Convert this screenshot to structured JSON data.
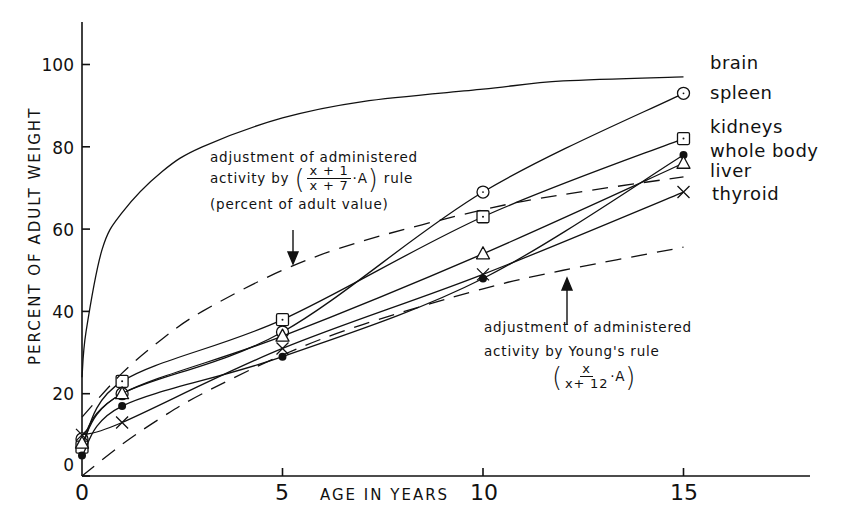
{
  "chart_data": {
    "type": "line",
    "title": "",
    "xlabel": "AGE IN YEARS",
    "ylabel": "PERCENT OF ADULT WEIGHT",
    "xlim": [
      0,
      18
    ],
    "ylim": [
      0,
      110
    ],
    "x_ticks": [
      "0",
      "5",
      "10",
      "15"
    ],
    "y_ticks": [
      "0",
      "20",
      "40",
      "60",
      "80",
      "100"
    ],
    "grid": false,
    "legend_position": "right, inline labels at line ends",
    "series": [
      {
        "name": "brain",
        "marker": "none",
        "style": "solid",
        "x": [
          0,
          0.1,
          0.5,
          1,
          2,
          3,
          5,
          7,
          10,
          12,
          15
        ],
        "y": [
          24,
          35,
          55,
          64,
          74,
          80,
          87,
          91,
          94,
          96,
          97
        ]
      },
      {
        "name": "spleen",
        "marker": "circle",
        "style": "solid",
        "x": [
          0,
          1,
          5,
          10,
          15
        ],
        "y": [
          9,
          20,
          35,
          69,
          93
        ]
      },
      {
        "name": "kidneys",
        "marker": "square",
        "style": "solid",
        "x": [
          0,
          1,
          5,
          10,
          15
        ],
        "y": [
          7,
          23,
          38,
          63,
          82
        ]
      },
      {
        "name": "whole body",
        "marker": "filled-circle",
        "style": "solid",
        "x": [
          0,
          1,
          5,
          10,
          15
        ],
        "y": [
          5,
          17,
          29,
          48,
          78
        ]
      },
      {
        "name": "liver",
        "marker": "triangle",
        "style": "solid",
        "x": [
          0,
          1,
          5,
          10,
          15
        ],
        "y": [
          8,
          20,
          34,
          54,
          76
        ]
      },
      {
        "name": "thyroid",
        "marker": "x",
        "style": "solid",
        "x": [
          0,
          1,
          5,
          10,
          15
        ],
        "y": [
          10,
          13,
          31,
          49,
          69
        ]
      },
      {
        "name": "(x+1)/(x+7)·A rule",
        "marker": "none",
        "style": "dashed",
        "x": [
          0,
          1,
          2,
          3,
          5,
          7,
          10,
          12,
          15
        ],
        "y": [
          14.3,
          25,
          33.3,
          40,
          50,
          57.1,
          64.7,
          68.4,
          72.7
        ]
      },
      {
        "name": "Young's rule x/(x+12)·A",
        "marker": "none",
        "style": "dashed",
        "x": [
          0,
          1,
          2,
          3,
          5,
          7,
          10,
          12,
          15
        ],
        "y": [
          0,
          7.7,
          14.3,
          20,
          29.4,
          36.8,
          45.5,
          50,
          55.6
        ]
      }
    ],
    "annotations": [
      {
        "text": "adjustment of administered activity by ((x+1)/(x+7)·A) rule (percent of adult value)",
        "points_to": "upper dashed curve near x=5"
      },
      {
        "text": "adjustment of administered activity by Young's rule (x/(x+12)·A)",
        "points_to": "lower dashed curve near x=11"
      }
    ]
  },
  "axes": {
    "xlabel": "AGE IN YEARS",
    "ylabel": "PERCENT OF ADULT WEIGHT",
    "x_ticks": [
      "0",
      "5",
      "10",
      "15"
    ],
    "y_ticks": [
      "0",
      "20",
      "40",
      "60",
      "80",
      "100"
    ]
  },
  "legend": [
    "brain",
    "spleen",
    "kidneys",
    "whole body",
    "liver",
    "thyroid"
  ],
  "annotations": {
    "upper": {
      "line1": "adjustment of administered",
      "line2_prefix": "activity by",
      "frac_num": "x + 1",
      "frac_den": "x + 7",
      "frac_suffix": "·A",
      "line2_suffix": "rule",
      "line3": "(percent of adult value)"
    },
    "lower": {
      "line1": "adjustment of administered",
      "line2": "activity by Young's rule",
      "frac_num": "x",
      "frac_den": "x+ 12",
      "frac_suffix": "·A"
    }
  }
}
